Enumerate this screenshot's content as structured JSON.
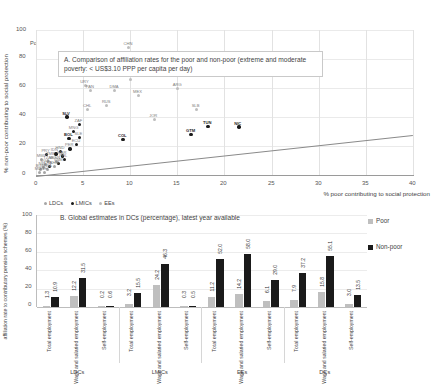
{
  "figure": {
    "poverty_note": "Poverty US$3.10 PPP"
  },
  "panel_a": {
    "title": "A. Comparison of affiliation rates for the poor and non-poor (extreme and moderate poverty: < US$3.10 PPP per capita per day)",
    "ylabel": "% non-poor contributing to social protection",
    "xlabel": "% poor contributing to social protection",
    "legend": [
      {
        "label": "LDCs",
        "color": "#a6a6a6"
      },
      {
        "label": "LMICs",
        "color": "#1a1a1a"
      },
      {
        "label": "EEs",
        "color": "#bdbdbd"
      }
    ],
    "yticks": [
      "0",
      "20",
      "40",
      "60",
      "80",
      "100"
    ],
    "xticks": [
      "0",
      "5",
      "10",
      "15",
      "20",
      "25",
      "30",
      "35",
      "40"
    ]
  },
  "panel_b": {
    "title": "B. Global estimates in DCs (percentage), latest year available",
    "ylabel": "affiliation rate to contributory pension schemes (%)",
    "yticks": [
      "0",
      "20",
      "40",
      "60",
      "80",
      "100"
    ],
    "legend": [
      {
        "label": "Poor",
        "color": "#bfbfbf"
      },
      {
        "label": "Non-poor",
        "color": "#1a1a1a"
      }
    ],
    "categories": [
      "Total employment",
      "Wage and salaried employment",
      "Self-employment"
    ],
    "groups": [
      "LDCs",
      "LMICs",
      "EEs",
      "DCs"
    ]
  },
  "chart_data": [
    {
      "type": "scatter",
      "title": "A. Comparison of affiliation rates for the poor and non-poor (extreme and moderate poverty: < US$3.10 PPP per capita per day)",
      "xlabel": "% poor contributing to social protection",
      "ylabel": "% non-poor contributing to social protection",
      "xlim": [
        0,
        40
      ],
      "ylim": [
        0,
        100
      ],
      "xticks": [
        0,
        5,
        10,
        15,
        20,
        25,
        30,
        35,
        40
      ],
      "yticks": [
        0,
        20,
        40,
        60,
        80,
        100
      ],
      "grid": true,
      "legend_position": "bottom-left",
      "reference_line": {
        "note": "45-degree-like trend line",
        "from": [
          0,
          0
        ],
        "to": [
          40,
          28
        ]
      },
      "series": [
        {
          "name": "LDCs",
          "color": "#a6a6a6",
          "points": [
            {
              "label": "BGD",
              "x": 0.5,
              "y": 3.5
            },
            {
              "label": "NPL",
              "x": 0.8,
              "y": 5.0
            },
            {
              "label": "UGA",
              "x": 1.0,
              "y": 7.0
            },
            {
              "label": "TZA",
              "x": 1.3,
              "y": 9.0
            },
            {
              "label": "MWI",
              "x": 0.6,
              "y": 11.0
            },
            {
              "label": "ZMB",
              "x": 1.6,
              "y": 12.0
            },
            {
              "label": "SEN",
              "x": 2.2,
              "y": 9.5
            },
            {
              "label": "MDG",
              "x": 0.4,
              "y": 2.0
            },
            {
              "label": "ETH",
              "x": 0.9,
              "y": 1.5
            },
            {
              "label": "RWA",
              "x": 1.2,
              "y": 4.0
            },
            {
              "label": "KHM",
              "x": 2.0,
              "y": 6.0
            }
          ]
        },
        {
          "name": "LMICs",
          "color": "#1a1a1a",
          "points": [
            {
              "label": "SLV",
              "x": 3.3,
              "y": 40.0
            },
            {
              "label": "ZAF",
              "x": 4.6,
              "y": 35.0
            },
            {
              "label": "BOL",
              "x": 3.5,
              "y": 25.0
            },
            {
              "label": "SLE",
              "x": 4.6,
              "y": 26.0
            },
            {
              "label": "ECU",
              "x": 4.3,
              "y": 21.0
            },
            {
              "label": "PER",
              "x": 3.6,
              "y": 18.0
            },
            {
              "label": "HND",
              "x": 2.6,
              "y": 16.0
            },
            {
              "label": "NIC",
              "x": 21.5,
              "y": 33.0
            },
            {
              "label": "GTM",
              "x": 16.4,
              "y": 28.0
            },
            {
              "label": "TUN",
              "x": 18.2,
              "y": 33.5
            },
            {
              "label": "COL",
              "x": 9.2,
              "y": 24.5
            },
            {
              "label": "MAR",
              "x": 2.8,
              "y": 13.0
            },
            {
              "label": "IDN",
              "x": 2.1,
              "y": 14.5
            },
            {
              "label": "PHL",
              "x": 3.0,
              "y": 10.5
            },
            {
              "label": "VNM",
              "x": 2.4,
              "y": 8.0
            },
            {
              "label": "LKA",
              "x": 1.4,
              "y": 6.0
            },
            {
              "label": "PRY",
              "x": 1.1,
              "y": 14.0
            },
            {
              "label": "MNG",
              "x": 4.0,
              "y": 30.0
            }
          ]
        },
        {
          "name": "EEs",
          "color": "#bdbdbd",
          "points": [
            {
              "label": "BRA",
              "x": 13.0,
              "y": 77.0
            },
            {
              "label": "CRI",
              "x": 23.5,
              "y": 75.0
            },
            {
              "label": "TUR",
              "x": 10.0,
              "y": 66.0
            },
            {
              "label": "ARG",
              "x": 15.0,
              "y": 60.0
            },
            {
              "label": "PAN",
              "x": 5.8,
              "y": 58.0
            },
            {
              "label": "DMA",
              "x": 8.3,
              "y": 58.0
            },
            {
              "label": "MEX",
              "x": 10.8,
              "y": 55.0
            },
            {
              "label": "RUS",
              "x": 7.5,
              "y": 48.0
            },
            {
              "label": "CHL",
              "x": 5.5,
              "y": 45.0
            },
            {
              "label": "SLB",
              "x": 17.0,
              "y": 45.0
            },
            {
              "label": "JOR",
              "x": 12.5,
              "y": 38.0
            },
            {
              "label": "CHN",
              "x": 9.8,
              "y": 88.0
            },
            {
              "label": "URY",
              "x": 5.2,
              "y": 62.0
            }
          ]
        }
      ]
    },
    {
      "type": "bar",
      "title": "B. Global estimates in DCs (percentage), latest year available",
      "ylabel": "affiliation rate to contributory pension schemes (%)",
      "ylim": [
        0,
        100
      ],
      "yticks": [
        0,
        20,
        40,
        60,
        80,
        100
      ],
      "grid": true,
      "legend_position": "right",
      "categories": [
        "LDCs - Total employment",
        "LDCs - Wage and salaried employment",
        "LDCs - Self-employment",
        "LMICs - Total employment",
        "LMICs - Wage and salaried employment",
        "LMICs - Self-employment",
        "EEs - Total employment",
        "EEs - Wage and salaried employment",
        "EEs - Self-employment",
        "DCs - Total employment",
        "DCs - Wage and salaried employment",
        "DCs - Self-employment"
      ],
      "series": [
        {
          "name": "Poor",
          "color": "#bfbfbf",
          "values": [
            1.3,
            12.2,
            0.2,
            3.2,
            24.2,
            0.3,
            11.2,
            14.2,
            6.1,
            7.9,
            15.8,
            3.0
          ]
        },
        {
          "name": "Non-poor",
          "color": "#1a1a1a",
          "values": [
            10.9,
            31.5,
            0.6,
            15.5,
            46.3,
            0.5,
            52.0,
            58.0,
            29.0,
            37.2,
            55.1,
            13.5
          ]
        }
      ]
    }
  ]
}
